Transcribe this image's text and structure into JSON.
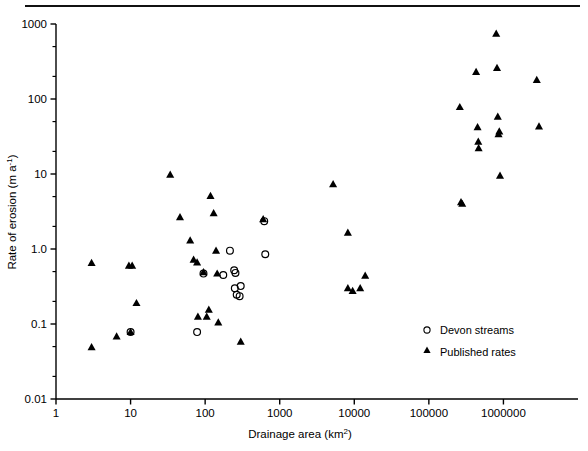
{
  "figure": {
    "divider_rule": "horizontal-rule",
    "background_color": "#ffffff",
    "ink_color": "#000000"
  },
  "axes": {
    "y_title_main": "Rate of erosion (m a",
    "y_title_sup": "-1",
    "y_title_close": ")",
    "x_title_main": "Drainage area (km",
    "x_title_sup": "2",
    "x_title_close": ")",
    "y_ticks": [
      "1000",
      "100",
      "10",
      "1.0",
      "0.1",
      "0.01"
    ],
    "x_ticks": [
      "1",
      "10",
      "100",
      "1000",
      "10000",
      "100000",
      "1000000"
    ]
  },
  "legend": {
    "items": [
      {
        "label": "Devon streams",
        "marker": "open-circle-marker"
      },
      {
        "label": "Published rates",
        "marker": "filled-triangle-marker"
      }
    ]
  },
  "chart_data": {
    "type": "scatter",
    "title": "",
    "xlabel": "Drainage area (km2)",
    "ylabel": "Rate of erosion (m a-1)",
    "xscale": "log",
    "yscale": "log",
    "xlim": [
      1,
      10000000
    ],
    "ylim": [
      0.01,
      1000
    ],
    "grid": false,
    "legend_position": "bottom-right",
    "xtick_values": [
      1,
      10,
      100,
      1000,
      10000,
      100000,
      1000000
    ],
    "ytick_values": [
      0.01,
      0.1,
      1.0,
      10,
      100,
      1000
    ],
    "series": [
      {
        "name": "Devon streams",
        "marker": "open-circle",
        "points": [
          [
            10.0,
            0.078
          ],
          [
            78.0,
            0.078
          ],
          [
            95.0,
            0.47
          ],
          [
            175.0,
            0.45
          ],
          [
            215.0,
            0.95
          ],
          [
            245.0,
            0.52
          ],
          [
            255.0,
            0.48
          ],
          [
            250.0,
            0.3
          ],
          [
            265.0,
            0.245
          ],
          [
            290.0,
            0.235
          ],
          [
            300.0,
            0.32
          ],
          [
            620.0,
            2.35
          ],
          [
            640.0,
            0.85
          ]
        ]
      },
      {
        "name": "Published rates",
        "marker": "filled-triangle",
        "points": [
          [
            3.0,
            0.65
          ],
          [
            3.0,
            0.049
          ],
          [
            6.5,
            0.068
          ],
          [
            9.5,
            0.6
          ],
          [
            10.5,
            0.6
          ],
          [
            10.0,
            0.078
          ],
          [
            12.0,
            0.19
          ],
          [
            34.0,
            9.8
          ],
          [
            46.0,
            2.65
          ],
          [
            63.0,
            1.3
          ],
          [
            70.0,
            0.72
          ],
          [
            78.0,
            0.66
          ],
          [
            80.0,
            0.125
          ],
          [
            95.0,
            0.49
          ],
          [
            105.0,
            0.125
          ],
          [
            112.0,
            0.155
          ],
          [
            118.0,
            5.1
          ],
          [
            130.0,
            3.0
          ],
          [
            140.0,
            0.95
          ],
          [
            145.0,
            0.47
          ],
          [
            150.0,
            0.105
          ],
          [
            300.0,
            0.058
          ],
          [
            600.0,
            2.5
          ],
          [
            5200.0,
            7.3
          ],
          [
            8200.0,
            1.65
          ],
          [
            8200.0,
            0.3
          ],
          [
            9500.0,
            0.275
          ],
          [
            12000.0,
            0.3
          ],
          [
            14000.0,
            0.44
          ],
          [
            260000.0,
            78.0
          ],
          [
            270000.0,
            4.2
          ],
          [
            280000.0,
            4.0
          ],
          [
            430000.0,
            230.0
          ],
          [
            450000.0,
            42.0
          ],
          [
            460000.0,
            27.0
          ],
          [
            465000.0,
            22.0
          ],
          [
            800000.0,
            740.0
          ],
          [
            820000.0,
            260.0
          ],
          [
            840000.0,
            58.0
          ],
          [
            860000.0,
            34.0
          ],
          [
            880000.0,
            37.0
          ],
          [
            900000.0,
            9.5
          ],
          [
            2800000.0,
            180.0
          ],
          [
            3000000.0,
            43.0
          ]
        ]
      }
    ]
  }
}
